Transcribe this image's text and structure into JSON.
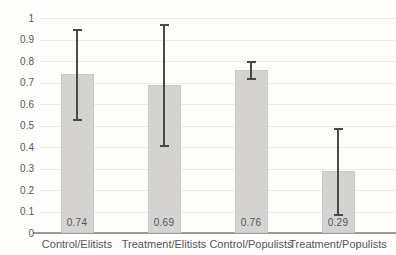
{
  "chart_data": {
    "type": "bar",
    "title": "",
    "xlabel": "",
    "ylabel": "",
    "categories": [
      "Control/Elitists",
      "Treatment/Elitists",
      "Control/Populists",
      "Treatment/Populists"
    ],
    "values": [
      0.74,
      0.69,
      0.76,
      0.29
    ],
    "value_labels": [
      "0.74",
      "0.69",
      "0.76",
      "0.29"
    ],
    "error_low": [
      0.53,
      0.41,
      0.72,
      0.09
    ],
    "error_high": [
      0.95,
      0.97,
      0.8,
      0.49
    ],
    "ylim": [
      0,
      1
    ],
    "ytick_step": 0.1,
    "ytick_labels": [
      "0",
      "0.1",
      "0.2",
      "0.3",
      "0.4",
      "0.5",
      "0.6",
      "0.7",
      "0.8",
      "0.9",
      "1"
    ],
    "grid": "horizontal",
    "legend": "none",
    "colors": {
      "bar_fill": "#d4d3d1",
      "bar_edge": "#c9c8c6",
      "error_bar": "#494947",
      "gridline": "#edebe7",
      "axis_line": "#9c9b99",
      "text": "#56575b",
      "background": "#fdfdfc"
    }
  }
}
